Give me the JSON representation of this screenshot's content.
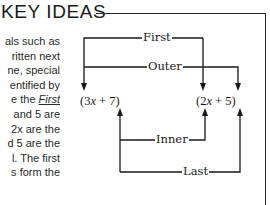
{
  "section": {
    "title": "KEY IDEAS"
  },
  "body_text": {
    "lines": [
      "als such as",
      "ritten next",
      "ne, special",
      "entified by",
      "e the ",
      " and 5 are",
      " 2x are the",
      "d 5 are the",
      "l. The first",
      "s form the"
    ],
    "emphasis_word": "First"
  },
  "diagram": {
    "left_expression": {
      "open": "(3",
      "var": "x",
      "rest": " + 7)"
    },
    "right_expression": {
      "open": "(2",
      "var": "x",
      "rest": " + 5)"
    },
    "labels": {
      "first": "First",
      "outer": "Outer",
      "inner": "Inner",
      "last": "Last"
    },
    "line_color": "#1a1a1a"
  }
}
